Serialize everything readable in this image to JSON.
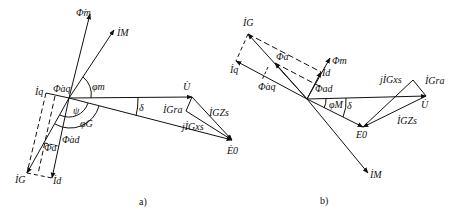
{
  "figure": {
    "panels": [
      {
        "id": "a",
        "caption": "a)",
        "labels": {
          "phi_m": "Φ̇m",
          "i_m": "İM",
          "i_q": "İq",
          "phi_aq": "Φ̇aq",
          "phi_m_angle": "φm",
          "psi": "ψ",
          "phi_g": "φG",
          "phi_ad": "Φ̇ad",
          "phi_a": "Φ̇a",
          "i_g": "İG",
          "i_d": "İd",
          "u": "U̇",
          "delta": "δ",
          "ig_ra": "İGra",
          "ig_zs": "İGZs",
          "j_ig_xs": "jİGxs",
          "e0": "Ė0"
        }
      },
      {
        "id": "b",
        "caption": "b)",
        "labels": {
          "i_g": "İG",
          "i_q": "İq",
          "phi_a": "Φa",
          "phi_m": "Φm",
          "i_d": "İd",
          "phi_ad": "Φad",
          "phi_aq": "Φ̇aq",
          "phi_m_angle": "φM",
          "delta": "δ",
          "j_ig_xs": "jİGxs",
          "ig_ra": "İGra",
          "u": "U̇",
          "ig_zs": "İGZs",
          "e0": "E0",
          "i_m": "İM"
        }
      }
    ]
  }
}
